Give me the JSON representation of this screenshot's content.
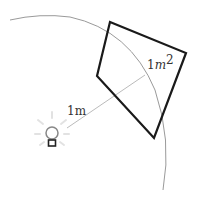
{
  "diagram": {
    "labels": {
      "distance": "1m",
      "area_num": "1",
      "area_var": "m",
      "area_exp": "2"
    },
    "elements": [
      {
        "type": "light-bulb",
        "position": [
          52,
          133
        ]
      },
      {
        "type": "arc",
        "description": "circle of radius 1m around light source"
      },
      {
        "type": "line",
        "description": "radius from bulb to surface",
        "from": [
          67,
          128
        ],
        "to": [
          145,
          75
        ]
      },
      {
        "type": "quadrilateral",
        "description": "1 square meter surface",
        "points": [
          [
            110,
            22
          ],
          [
            186,
            53
          ],
          [
            154,
            138
          ],
          [
            97,
            76
          ]
        ]
      }
    ],
    "colors": {
      "outline": "#1a1a1a",
      "arc": "#9a9a9a",
      "ray": "#bbbbbb",
      "text": "#333333"
    }
  }
}
